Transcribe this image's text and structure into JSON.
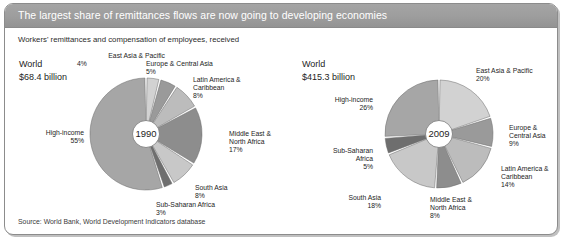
{
  "figure": {
    "title": "The largest share of remittances flows are now going to developing economies",
    "subtitle": "Workers' remittances and compensation of employees, received",
    "source": "Source: World Bank, World Development Indicators database",
    "accent_band_color": "#9d9d9d",
    "frame_border_color": "#8c8c8c"
  },
  "chart_data": {
    "type": "pie",
    "title": "The largest share of remittances flows are now going to developing economies",
    "subtitle": "Workers' remittances and compensation of employees, received",
    "source": "Source: World Bank, World Development Indicators database",
    "units": "percent of total",
    "panels": [
      {
        "id": "pie-1990",
        "year": "1990",
        "world_label": "World",
        "world_total": "$68.4 billion",
        "categories": [
          "East Asia & Pacific",
          "Europe & Central Asia",
          "Latin America & Caribbean",
          "Middle East & North Africa",
          "South Asia",
          "Sub-Saharan Africa",
          "High-income"
        ],
        "values": [
          4,
          5,
          8,
          17,
          8,
          3,
          55
        ],
        "labels": [
          {
            "name": "East Asia & Pacific",
            "pct": "4%",
            "color": "#d2d2d2"
          },
          {
            "name": "Europe & Central Asia",
            "pct": "5%",
            "color": "#9a9a9a"
          },
          {
            "name": "Latin America & Caribbean",
            "pct": "8%",
            "color": "#bcbcbc"
          },
          {
            "name": "Middle East & North Africa",
            "pct": "17%",
            "color": "#8d8d8d"
          },
          {
            "name": "South Asia",
            "pct": "8%",
            "color": "#c8c8c8"
          },
          {
            "name": "Sub-Saharan Africa",
            "pct": "3%",
            "color": "#6e6e6e"
          },
          {
            "name": "High-income",
            "pct": "55%",
            "color": "#a6a6a6"
          }
        ]
      },
      {
        "id": "pie-2009",
        "year": "2009",
        "world_label": "World",
        "world_total": "$415.3 billion",
        "categories": [
          "East Asia & Pacific",
          "Europe & Central Asia",
          "Latin America & Caribbean",
          "Middle East & North Africa",
          "South Asia",
          "Sub-Saharan Africa",
          "High-income"
        ],
        "values": [
          20,
          9,
          14,
          8,
          18,
          5,
          26
        ],
        "labels": [
          {
            "name": "East Asia & Pacific",
            "pct": "20%",
            "color": "#d2d2d2"
          },
          {
            "name": "Europe & Central Asia",
            "pct": "9%",
            "color": "#9a9a9a"
          },
          {
            "name": "Latin America & Caribbean",
            "pct": "14%",
            "color": "#bcbcbc"
          },
          {
            "name": "Middle East & North Africa",
            "pct": "8%",
            "color": "#8d8d8d"
          },
          {
            "name": "South Asia",
            "pct": "18%",
            "color": "#c8c8c8"
          },
          {
            "name": "Sub-Saharan Africa",
            "pct": "5%",
            "color": "#6e6e6e"
          },
          {
            "name": "High-income",
            "pct": "26%",
            "color": "#a6a6a6"
          }
        ]
      }
    ]
  },
  "left_panel": {
    "world_label": "World",
    "world_total": "$68.4 billion",
    "year": "1990",
    "l_eap_name": "East Asia & Pacific",
    "l_eap_pct": "4%",
    "l_eca_name": "Europe & Central Asia",
    "l_eca_pct": "5%",
    "l_lac_name1": "Latin America &",
    "l_lac_name2": "Caribbean",
    "l_lac_pct": "8%",
    "l_mena_name1": "Middle East &",
    "l_mena_name2": "North Africa",
    "l_mena_pct": "17%",
    "l_sa_name": "South Asia",
    "l_sa_pct": "8%",
    "l_ssa_name": "Sub-Saharan Africa",
    "l_ssa_pct": "3%",
    "l_hi_name": "High-income",
    "l_hi_pct": "55%"
  },
  "right_panel": {
    "world_label": "World",
    "world_total": "$415.3 billion",
    "year": "2009",
    "r_eap_name": "East Asia & Pacific",
    "r_eap_pct": "20%",
    "r_eca_name1": "Europe &",
    "r_eca_name2": "Central Asia",
    "r_eca_pct": "9%",
    "r_lac_name1": "Latin America &",
    "r_lac_name2": "Caribbean",
    "r_lac_pct": "14%",
    "r_mena_name1": "Middle East &",
    "r_mena_name2": "North Africa",
    "r_mena_pct": "8%",
    "r_sa_name": "South Asia",
    "r_sa_pct": "18%",
    "r_ssa_name1": "Sub-Saharan",
    "r_ssa_name2": "Africa",
    "r_ssa_pct": "5%",
    "r_hi_name": "High-income",
    "r_hi_pct": "26%"
  }
}
